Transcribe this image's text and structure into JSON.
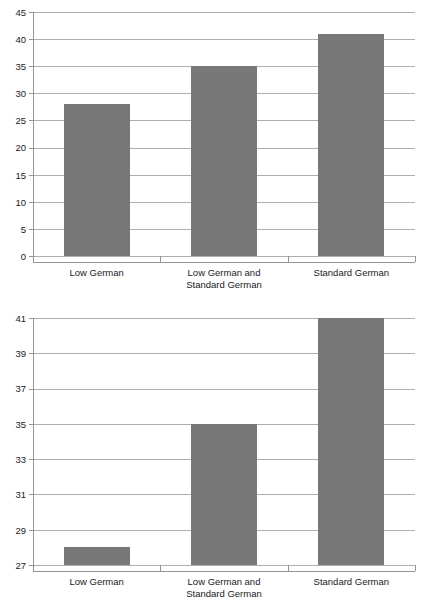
{
  "page": {
    "background_color": "#ffffff",
    "width": 429,
    "height": 607,
    "cropped_caption_fragment": "g p"
  },
  "style": {
    "bar_color": "#787878",
    "gridline_color": "#9a9a9a",
    "axis_color": "#8a8a8a",
    "text_color": "#1a1a1a"
  },
  "chart_data": [
    {
      "id": "chart-top",
      "type": "bar",
      "title": "",
      "subtitle": "",
      "xlabel": "",
      "ylabel": "",
      "categories": [
        "Low German",
        "Low German and Standard German",
        "Standard German"
      ],
      "category_lines": [
        [
          "Low German"
        ],
        [
          "Low German and",
          "Standard German"
        ],
        [
          "Standard German"
        ]
      ],
      "values": [
        28,
        35,
        41
      ],
      "ylim": [
        0,
        45
      ],
      "ytick_step": 5,
      "yticks": [
        0,
        5,
        10,
        15,
        20,
        25,
        30,
        35,
        40,
        45
      ],
      "ytick_labels": [
        "0",
        "5",
        "10",
        "15",
        "20",
        "25",
        "30",
        "35",
        "40",
        "45"
      ],
      "grid": true,
      "grid_axis": "y",
      "legend": false,
      "legend_position": "none",
      "bar_color": "#787878"
    },
    {
      "id": "chart-bottom",
      "type": "bar",
      "title": "",
      "subtitle": "",
      "xlabel": "",
      "ylabel": "",
      "categories": [
        "Low German",
        "Low German and Standard German",
        "Standard German"
      ],
      "category_lines": [
        [
          "Low German"
        ],
        [
          "Low German and",
          "Standard German"
        ],
        [
          "Standard German"
        ]
      ],
      "values": [
        28,
        35,
        41
      ],
      "ylim": [
        27,
        41
      ],
      "ytick_step": 2,
      "yticks": [
        27,
        29,
        31,
        33,
        35,
        37,
        39,
        41
      ],
      "ytick_labels": [
        "27",
        "29",
        "31",
        "33",
        "35",
        "37",
        "39",
        "41"
      ],
      "grid": true,
      "grid_axis": "y",
      "legend": false,
      "legend_position": "none",
      "bar_color": "#787878"
    }
  ]
}
